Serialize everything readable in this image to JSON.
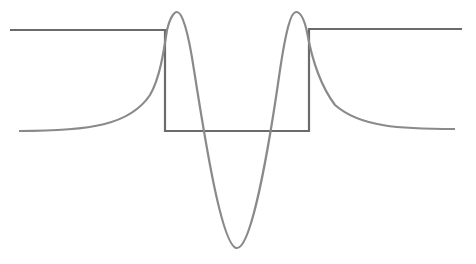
{
  "diagram": {
    "colors": {
      "well": "#6b6b6b",
      "wavefunction": "#8a8a8a",
      "background": "#ffffff"
    },
    "well": {
      "points": "10,30 165,30 165,131 309,131 309,29 462,29"
    },
    "wavefunction": {
      "path": "M19,131 C90,131 130,125 150,95 C160,78 164,50 167,30 C170,18 174,12 177,12 C182,12 188,30 194,70 C205,140 222,248 237,248 C252,248 270,140 280,70 C286,30 291,12 296,12 C300,12 304,18 307,32 C312,60 320,85 335,105 C360,127 400,129 455,129"
    }
  }
}
